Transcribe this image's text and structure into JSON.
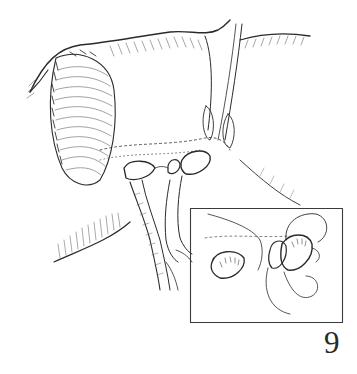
{
  "figure": {
    "number": "9",
    "style": "black ink line drawing on white",
    "main_illustration": "anatomical surgical view with shaded oval structure at left, central ducts/vessels and paired openings",
    "inset": {
      "present": true,
      "description": "boxed magnified detail showing two openings with looped suture thread"
    }
  },
  "colors": {
    "background": "#ffffff",
    "ink": "#2a2a2a",
    "hatch": "#6a6a6a",
    "inset_border": "#3a3a3a"
  }
}
